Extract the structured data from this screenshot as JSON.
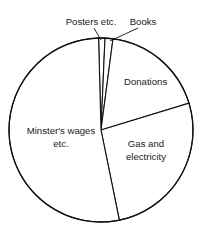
{
  "chart_data": {
    "type": "pie",
    "title": "",
    "subtitle": "",
    "xlabel": "",
    "ylabel": "",
    "legend_position": "none",
    "grid": false,
    "labels_on_chart": true,
    "center": {
      "x": 101,
      "y": 130
    },
    "radius": 92,
    "start_angle_deg": -1.5,
    "categories": [
      "Posters etc.",
      "Books",
      "Donations",
      "Gas and electricity",
      "Minster's wages etc."
    ],
    "values": [
      2.5,
      5.0,
      19.5,
      26.5,
      46.5
    ],
    "units": "percent",
    "slices": [
      {
        "name": "Posters etc.",
        "label": "Posters etc.",
        "value": 2.5,
        "start_deg": -1.5,
        "end_deg": 2.5,
        "label_x": 91,
        "label_y": 22,
        "label_anchor": "middle",
        "leader": {
          "x1": 94,
          "y1": 28,
          "x2": 101,
          "y2": 40
        },
        "color": "#ffffff",
        "stroke": "#111111"
      },
      {
        "name": "Books",
        "label": "Books",
        "value": 5.0,
        "start_deg": 2.5,
        "end_deg": 7.5,
        "label_x": 143,
        "label_y": 22,
        "label_anchor": "middle",
        "leader": {
          "x1": 138,
          "y1": 28,
          "x2": 110,
          "y2": 41
        },
        "color": "#ffffff",
        "stroke": "#111111"
      },
      {
        "name": "Donations",
        "label": "Donations",
        "value": 19.5,
        "start_deg": 7.5,
        "end_deg": 73.0,
        "label_x": 124,
        "label_y": 82,
        "label_anchor": "start",
        "leader": null,
        "color": "#ffffff",
        "stroke": "#111111"
      },
      {
        "name": "Gas and electricity",
        "label_line_1": "Gas and",
        "label_line_2": "electricity",
        "value": 26.5,
        "start_deg": 73.0,
        "end_deg": 168.5,
        "label_x": 146,
        "label_y": 144,
        "label_anchor": "middle",
        "leader": null,
        "color": "#ffffff",
        "stroke": "#111111"
      },
      {
        "name": "Minster's wages etc.",
        "label_line_1": "Minster's wages",
        "label_line_2": "etc.",
        "value": 46.5,
        "start_deg": 168.5,
        "end_deg": 358.5,
        "label_x": 61,
        "label_y": 131,
        "label_anchor": "middle",
        "leader": null,
        "color": "#ffffff",
        "stroke": "#111111"
      }
    ]
  },
  "colors": {
    "background": "#ffffff",
    "stroke": "#111111",
    "text": "#1a1a1a"
  }
}
